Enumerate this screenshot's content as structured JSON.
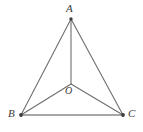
{
  "figure": {
    "type": "geometry-diagram",
    "background_color": "#ffffff",
    "line_color": "#6e6e6e",
    "base_line_color": "#8a8a8a",
    "label_color": "#3a3a3a",
    "vertex_dot_color": "#3d3d3d",
    "labels": {
      "apex": "A",
      "bottom_left": "B",
      "bottom_right": "C",
      "center": "O"
    },
    "points": {
      "A": {
        "x": 71,
        "y": 19
      },
      "B": {
        "x": 21,
        "y": 115
      },
      "C": {
        "x": 123,
        "y": 115
      },
      "O": {
        "x": 71,
        "y": 84
      }
    },
    "segments": [
      {
        "name": "AB",
        "from": "A",
        "to": "B"
      },
      {
        "name": "AC",
        "from": "A",
        "to": "C"
      },
      {
        "name": "BC",
        "from": "B",
        "to": "C"
      },
      {
        "name": "AO",
        "from": "A",
        "to": "O"
      },
      {
        "name": "BO",
        "from": "B",
        "to": "O"
      },
      {
        "name": "CO",
        "from": "C",
        "to": "O"
      }
    ]
  }
}
